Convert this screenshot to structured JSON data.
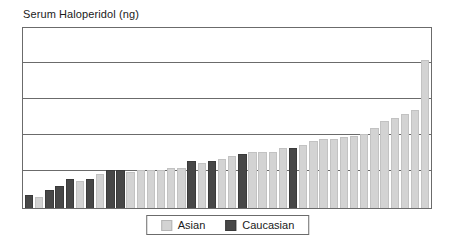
{
  "chart_data": {
    "type": "bar",
    "title": "Serum Haloperidol (ng)",
    "xlabel": "",
    "ylabel": "Serum Haloperidol (ng)",
    "ylim": [
      0,
      100
    ],
    "grid": true,
    "gridlines": [
      20,
      40,
      60,
      80
    ],
    "legend_position": "bottom-center",
    "x_tick_labels": [],
    "y_tick_labels": [],
    "categories": [
      "1",
      "2",
      "3",
      "4",
      "5",
      "6",
      "7",
      "8",
      "9",
      "10",
      "11",
      "12",
      "13",
      "14",
      "15",
      "16",
      "17",
      "18",
      "19",
      "20",
      "21",
      "22",
      "23",
      "24",
      "25",
      "26",
      "27",
      "28",
      "29",
      "30",
      "31",
      "32",
      "33",
      "34",
      "35",
      "36",
      "37",
      "38",
      "39",
      "40"
    ],
    "values": [
      7,
      6,
      10,
      12,
      16,
      15,
      16,
      19,
      21,
      21,
      20,
      21,
      21,
      21,
      22,
      22,
      26,
      25,
      26,
      27,
      29,
      30,
      31,
      31,
      31,
      33,
      33,
      35,
      37,
      38,
      38,
      39,
      40,
      41,
      44,
      48,
      50,
      52,
      54,
      82
    ],
    "groups": [
      "Caucasian",
      "Asian",
      "Caucasian",
      "Caucasian",
      "Caucasian",
      "Asian",
      "Caucasian",
      "Asian",
      "Caucasian",
      "Caucasian",
      "Asian",
      "Asian",
      "Asian",
      "Asian",
      "Asian",
      "Asian",
      "Caucasian",
      "Asian",
      "Caucasian",
      "Asian",
      "Asian",
      "Caucasian",
      "Asian",
      "Asian",
      "Asian",
      "Asian",
      "Caucasian",
      "Asian",
      "Asian",
      "Asian",
      "Asian",
      "Asian",
      "Asian",
      "Asian",
      "Asian",
      "Asian",
      "Asian",
      "Asian",
      "Asian",
      "Asian"
    ],
    "series": [
      {
        "name": "Asian",
        "color": "#d3d3d3"
      },
      {
        "name": "Caucasian",
        "color": "#474747"
      }
    ]
  },
  "legend": {
    "entries": [
      {
        "label": "Asian",
        "swatch": "asian-swatch"
      },
      {
        "label": "Caucasian",
        "swatch": "caucasian-swatch"
      }
    ]
  },
  "colors": {
    "asian": "#d3d3d3",
    "caucasian": "#474747",
    "frame": "#6b6b6b",
    "background": "#ffffff",
    "text": "#1a1a1a"
  }
}
